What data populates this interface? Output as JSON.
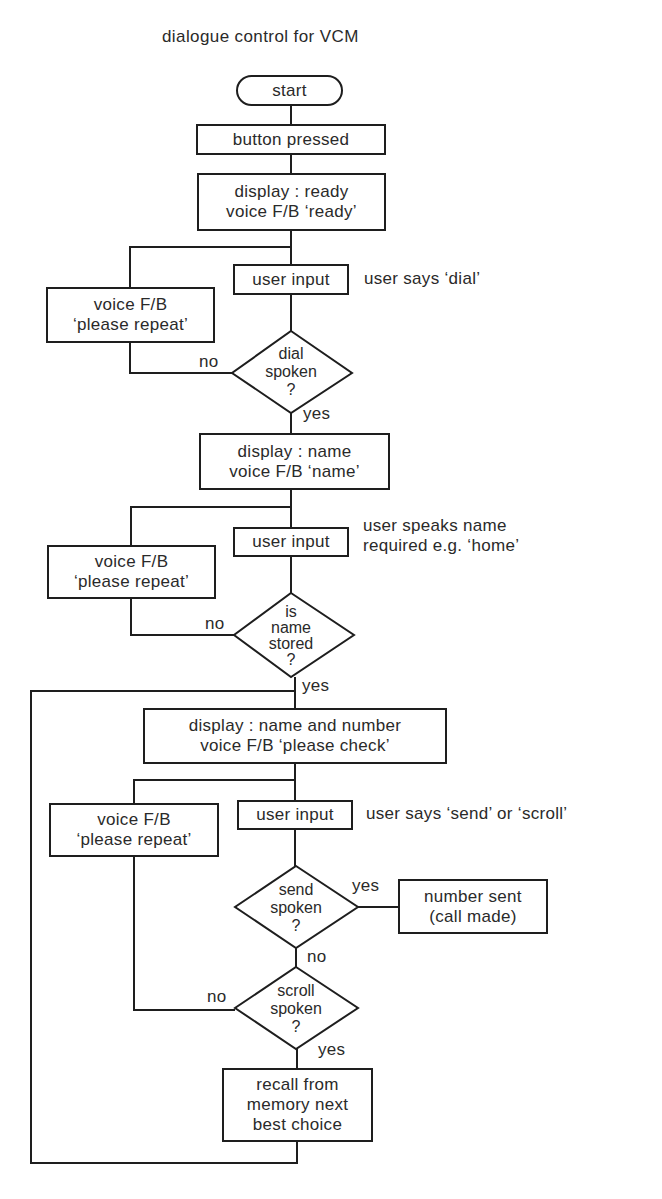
{
  "title": "dialogue control for VCM",
  "nodes": {
    "start": "start",
    "button_pressed": "button pressed",
    "display_ready": [
      "display : ready",
      "voice F/B ‘ready’"
    ],
    "user_input_1": "user input",
    "repeat_1": [
      "voice F/B",
      "‘please repeat’"
    ],
    "dial_spoken": [
      "dial",
      "spoken",
      "?"
    ],
    "display_name": [
      "display : name",
      "voice F/B ‘name’"
    ],
    "user_input_2": "user input",
    "repeat_2": [
      "voice F/B",
      "‘please repeat’"
    ],
    "name_stored": [
      "is",
      "name",
      "stored",
      "?"
    ],
    "display_check": [
      "display : name and number",
      "voice F/B ‘please check’"
    ],
    "user_input_3": "user input",
    "repeat_3": [
      "voice F/B",
      "‘please repeat’"
    ],
    "send_spoken": [
      "send",
      "spoken",
      "?"
    ],
    "number_sent": [
      "number sent",
      "(call made)"
    ],
    "scroll_spoken": [
      "scroll",
      "spoken",
      "?"
    ],
    "recall": [
      "recall from",
      "memory next",
      "best choice"
    ]
  },
  "annotations": {
    "user_says_dial": "user says ‘dial’",
    "user_speaks_name": [
      "user speaks name",
      "required e.g. ‘home’"
    ],
    "user_says_send_scroll": "user says ‘send’ or ‘scroll’"
  },
  "edge_labels": {
    "dial_no": "no",
    "dial_yes": "yes",
    "name_no": "no",
    "name_yes": "yes",
    "send_yes": "yes",
    "send_no": "no",
    "scroll_no": "no",
    "scroll_yes": "yes"
  },
  "colors": {
    "line": "#1e1e1e",
    "text": "#2a2a2a",
    "background": "#ffffff"
  }
}
